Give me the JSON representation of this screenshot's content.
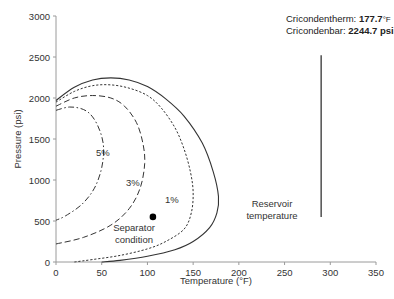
{
  "chart_data": {
    "type": "line",
    "title": "",
    "xlabel": "Temperature (°F)",
    "ylabel": "Pressure (psi)",
    "xlim": [
      0,
      350
    ],
    "ylim": [
      0,
      3000
    ],
    "x_ticks": [
      0,
      50,
      100,
      150,
      200,
      250,
      300,
      350
    ],
    "y_ticks": [
      0,
      500,
      1000,
      1500,
      2000,
      2500,
      3000
    ],
    "grid": false,
    "legend": "none",
    "series": [
      {
        "name": "Phase envelope (0% / bubble-dew)",
        "style": "solid",
        "points": [
          [
            0,
            1970
          ],
          [
            20,
            2130
          ],
          [
            40,
            2220
          ],
          [
            60,
            2245
          ],
          [
            80,
            2220
          ],
          [
            100,
            2140
          ],
          [
            120,
            1990
          ],
          [
            140,
            1780
          ],
          [
            160,
            1450
          ],
          [
            172,
            1100
          ],
          [
            177.7,
            800
          ],
          [
            176,
            600
          ],
          [
            168,
            420
          ],
          [
            150,
            250
          ],
          [
            130,
            150
          ],
          [
            100,
            70
          ],
          [
            70,
            20
          ],
          [
            50,
            0
          ]
        ]
      },
      {
        "name": "1%",
        "style": "dotted",
        "points": [
          [
            0,
            1950
          ],
          [
            20,
            2080
          ],
          [
            40,
            2150
          ],
          [
            60,
            2160
          ],
          [
            80,
            2120
          ],
          [
            100,
            2030
          ],
          [
            115,
            1880
          ],
          [
            130,
            1640
          ],
          [
            140,
            1380
          ],
          [
            147,
            1100
          ],
          [
            150,
            850
          ],
          [
            148,
            600
          ],
          [
            140,
            400
          ],
          [
            120,
            250
          ],
          [
            100,
            160
          ],
          [
            70,
            80
          ],
          [
            40,
            30
          ],
          [
            20,
            0
          ]
        ]
      },
      {
        "name": "3%",
        "style": "dash",
        "points": [
          [
            0,
            1900
          ],
          [
            20,
            2000
          ],
          [
            40,
            2030
          ],
          [
            60,
            2000
          ],
          [
            75,
            1900
          ],
          [
            88,
            1700
          ],
          [
            95,
            1450
          ],
          [
            97,
            1200
          ],
          [
            92,
            900
          ],
          [
            80,
            650
          ],
          [
            60,
            450
          ],
          [
            30,
            300
          ],
          [
            0,
            220
          ]
        ]
      },
      {
        "name": "5%",
        "style": "dash-dot",
        "points": [
          [
            0,
            1850
          ],
          [
            15,
            1890
          ],
          [
            30,
            1860
          ],
          [
            40,
            1770
          ],
          [
            48,
            1600
          ],
          [
            52,
            1400
          ],
          [
            50,
            1150
          ],
          [
            42,
            900
          ],
          [
            28,
            700
          ],
          [
            10,
            560
          ],
          [
            0,
            510
          ]
        ]
      }
    ],
    "points": [
      {
        "name": "Separator condition",
        "x": 106,
        "y": 550
      }
    ],
    "vertical_lines": [
      {
        "name": "Reservoir temperature",
        "x": 290,
        "y_from": 550,
        "y_to": 2520
      }
    ],
    "annotations": [
      {
        "text": "5%",
        "x": 18,
        "y": 1330
      },
      {
        "text": "3%",
        "x": 58,
        "y": 960
      },
      {
        "text": "1%",
        "x": 133,
        "y": 760
      },
      {
        "text": "Separator condition",
        "x": 80,
        "y": 300
      },
      {
        "text": "Reservoir temperature",
        "x": 270,
        "y": 650
      },
      {
        "text": "Cricondentherm: 177.7°F",
        "x": 315,
        "y": 2830
      },
      {
        "text": "Cricondenbar: 2244.7 psi",
        "x": 315,
        "y": 2690
      }
    ]
  },
  "axes": {
    "xlabel": "Temperature (°F)",
    "ylabel": "Pressure (psi)",
    "x_ticks": [
      "0",
      "50",
      "100",
      "150",
      "200",
      "250",
      "300",
      "350"
    ],
    "y_ticks": [
      "0",
      "500",
      "1000",
      "1500",
      "2000",
      "2500",
      "3000"
    ]
  },
  "labels": {
    "pct5": "5%",
    "pct3": "3%",
    "pct1": "1%",
    "separator_line1": "Separator",
    "separator_line2": "condition",
    "reservoir_line1": "Reservoir",
    "reservoir_line2": "temperature",
    "cricondentherm_label": "Cricondentherm: ",
    "cricondentherm_value": "177.7",
    "cricondentherm_unit": "°F",
    "cricondenbar_label": "Cricondenbar: ",
    "cricondenbar_value": "2244.7 psi"
  }
}
